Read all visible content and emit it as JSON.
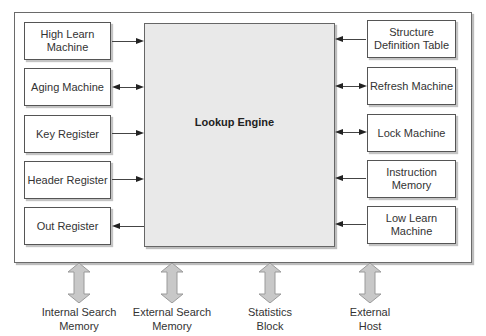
{
  "diagram": {
    "center": {
      "label": "Lookup Engine",
      "fill": "#e9e9e9"
    },
    "left_blocks": [
      {
        "label": "High Learn Machine",
        "lines": [
          "High Learn",
          "Machine"
        ],
        "connection": "to-engine"
      },
      {
        "label": "Aging Machine",
        "lines": [
          "Aging Machine"
        ],
        "connection": "bidirectional"
      },
      {
        "label": "Key Register",
        "lines": [
          "Key Register"
        ],
        "connection": "to-engine"
      },
      {
        "label": "Header Register",
        "lines": [
          "Header Register"
        ],
        "connection": "to-engine"
      },
      {
        "label": "Out Register",
        "lines": [
          "Out Register"
        ],
        "connection": "from-engine"
      }
    ],
    "right_blocks": [
      {
        "label": "Structure Definition Table",
        "lines": [
          "Structure",
          "Definition Table"
        ],
        "connection": "to-engine"
      },
      {
        "label": "Refresh Machine",
        "lines": [
          "Refresh Machine"
        ],
        "connection": "bidirectional"
      },
      {
        "label": "Lock Machine",
        "lines": [
          "Lock Machine"
        ],
        "connection": "bidirectional"
      },
      {
        "label": "Instruction Memory",
        "lines": [
          "Instruction",
          "Memory"
        ],
        "connection": "to-engine"
      },
      {
        "label": "Low Learn Machine",
        "lines": [
          "Low Learn",
          "Machine"
        ],
        "connection": "to-engine"
      }
    ],
    "external": [
      {
        "label": "Internal Search Memory",
        "lines": [
          "Internal Search",
          "Memory"
        ]
      },
      {
        "label": "External Search Memory",
        "lines": [
          "External Search",
          "Memory"
        ]
      },
      {
        "label": "Statistics Block",
        "lines": [
          "Statistics",
          "Block"
        ]
      },
      {
        "label": "External Host",
        "lines": [
          "External",
          "Host"
        ]
      }
    ],
    "colors": {
      "border": "#555555",
      "arrow": "#222222",
      "fat_arrow": "#c8c8c8",
      "fat_arrow_edge": "#9a9a9a"
    }
  }
}
